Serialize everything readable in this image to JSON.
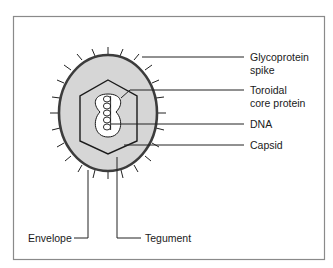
{
  "figure": {
    "colors": {
      "frame": "#8a8a8a",
      "envelope_outline": "#3c3c3c",
      "tegument_fill": "#d6d6d6",
      "core_fill": "#ffffff",
      "lines": "#222222"
    }
  },
  "labels": {
    "glycoprotein_line1": "Glycoprotein",
    "glycoprotein_line2": "spike",
    "toroidal_line1": "Toroidal",
    "toroidal_line2": "core protein",
    "dna": "DNA",
    "capsid": "Capsid",
    "envelope": "Envelope",
    "tegument": "Tegument"
  }
}
